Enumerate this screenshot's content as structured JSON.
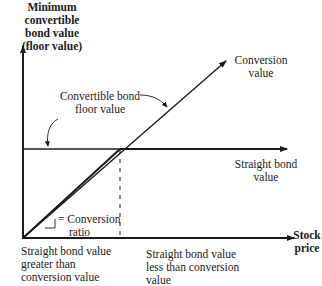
{
  "diagram": {
    "y_axis_label": [
      "Minimum convertible",
      "bond value",
      "(floor value)"
    ],
    "x_axis_label": [
      "Stock",
      "price"
    ],
    "conversion_value_label": [
      "Conversion",
      "value"
    ],
    "floor_value_label": [
      "Convertible bond",
      "floor value"
    ],
    "straight_bond_label": [
      "Straight bond",
      "value"
    ],
    "slope_label": [
      "= Conversion",
      "ratio"
    ],
    "left_region_label": [
      "Straight bond value",
      "greater than",
      "conversion value"
    ],
    "right_region_label": [
      "Straight bond value",
      "less than conversion",
      "value"
    ],
    "colors": {
      "line": "#1a1a1a",
      "background": "#ffffff"
    }
  }
}
